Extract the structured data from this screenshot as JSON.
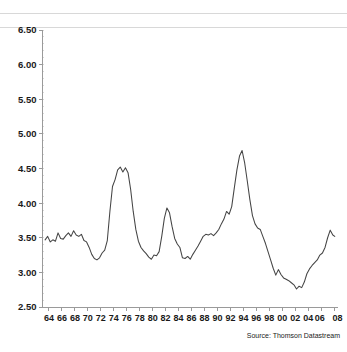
{
  "source_note": "Source: Thomson Datastream",
  "axes": {
    "y_ticks": [
      "2.50",
      "3.00",
      "3.50",
      "4.00",
      "4.50",
      "5.00",
      "5.50",
      "6.00",
      "6.50"
    ],
    "x_ticks": [
      "64",
      "66",
      "68",
      "70",
      "72",
      "74",
      "76",
      "78",
      "80",
      "82",
      "84",
      "86",
      "88",
      "90",
      "92",
      "94",
      "96",
      "98",
      "00",
      "02",
      "04",
      "06",
      "08"
    ]
  },
  "style": {
    "line_color": "#444444",
    "axis_color": "#9a9a9a",
    "text_color": "#1a1a1a",
    "background": "#ffffff"
  },
  "chart_data": {
    "type": "line",
    "title": "",
    "subtitle": "",
    "xlabel": "",
    "ylabel": "",
    "xlim": [
      1963.0,
      2008.6
    ],
    "ylim": [
      2.5,
      6.5
    ],
    "y_tick_step": 0.5,
    "x_tick_step": 2,
    "grid": false,
    "legend": null,
    "annotations": [
      "Source: Thomson Datastream"
    ],
    "series": [
      {
        "name": "series-1",
        "x": [
          1963.4,
          1963.8,
          1964.2,
          1964.6,
          1965.0,
          1965.4,
          1965.8,
          1966.2,
          1966.6,
          1967.0,
          1967.4,
          1967.8,
          1968.2,
          1968.6,
          1969.0,
          1969.4,
          1969.8,
          1970.2,
          1970.6,
          1971.0,
          1971.4,
          1971.8,
          1972.2,
          1972.6,
          1973.0,
          1973.4,
          1973.8,
          1974.2,
          1974.6,
          1975.0,
          1975.4,
          1975.8,
          1976.2,
          1976.6,
          1977.0,
          1977.4,
          1977.8,
          1978.2,
          1978.6,
          1979.0,
          1979.4,
          1979.8,
          1980.2,
          1980.6,
          1981.0,
          1981.4,
          1981.8,
          1982.2,
          1982.6,
          1983.0,
          1983.4,
          1983.8,
          1984.2,
          1984.6,
          1985.0,
          1985.4,
          1985.8,
          1986.2,
          1986.6,
          1987.0,
          1987.4,
          1987.8,
          1988.2,
          1988.6,
          1989.0,
          1989.4,
          1989.8,
          1990.2,
          1990.6,
          1991.0,
          1991.4,
          1991.8,
          1992.2,
          1992.6,
          1993.0,
          1993.4,
          1993.8,
          1994.2,
          1994.6,
          1995.0,
          1995.4,
          1995.8,
          1996.2,
          1996.6,
          1997.0,
          1997.4,
          1997.8,
          1998.2,
          1998.6,
          1999.0,
          1999.4,
          1999.8,
          2000.2,
          2000.6,
          2001.0,
          2001.4,
          2001.8,
          2002.2,
          2002.6,
          2003.0,
          2003.4,
          2003.8,
          2004.2,
          2004.6,
          2005.0,
          2005.4,
          2005.8,
          2006.2,
          2006.6,
          2007.0,
          2007.4,
          2007.8,
          2008.1
        ],
        "y": [
          3.47,
          3.52,
          3.44,
          3.47,
          3.45,
          3.57,
          3.49,
          3.48,
          3.53,
          3.57,
          3.52,
          3.6,
          3.54,
          3.52,
          3.55,
          3.46,
          3.44,
          3.36,
          3.26,
          3.2,
          3.18,
          3.21,
          3.28,
          3.32,
          3.46,
          3.88,
          4.24,
          4.34,
          4.48,
          4.52,
          4.45,
          4.51,
          4.44,
          4.2,
          3.88,
          3.62,
          3.45,
          3.36,
          3.31,
          3.27,
          3.22,
          3.19,
          3.25,
          3.24,
          3.3,
          3.52,
          3.78,
          3.93,
          3.86,
          3.66,
          3.49,
          3.41,
          3.36,
          3.21,
          3.2,
          3.23,
          3.19,
          3.26,
          3.32,
          3.38,
          3.45,
          3.52,
          3.55,
          3.54,
          3.56,
          3.53,
          3.57,
          3.62,
          3.7,
          3.77,
          3.88,
          3.84,
          3.95,
          4.22,
          4.48,
          4.68,
          4.76,
          4.58,
          4.32,
          4.05,
          3.82,
          3.7,
          3.64,
          3.62,
          3.52,
          3.42,
          3.3,
          3.18,
          3.06,
          2.96,
          3.04,
          2.97,
          2.92,
          2.9,
          2.88,
          2.85,
          2.82,
          2.76,
          2.8,
          2.78,
          2.86,
          2.98,
          3.05,
          3.1,
          3.14,
          3.18,
          3.25,
          3.28,
          3.36,
          3.5,
          3.61,
          3.54,
          3.52
        ]
      }
    ],
    "series_tail": {
      "name": "series-1-continued",
      "x": [
        2008.1,
        2008.2,
        2008.3,
        2008.4,
        2008.5
      ],
      "y": [
        3.52,
        3.7,
        3.88,
        4.3,
        5.0
      ]
    },
    "notable_points": [
      {
        "label": "early-plateau",
        "x": 1965,
        "y": 3.5
      },
      {
        "label": "1969-dip",
        "x": 1969.8,
        "y": 3.18
      },
      {
        "label": "1973-peak",
        "x": 1973.2,
        "y": 4.52
      },
      {
        "label": "1976-trough",
        "x": 1976.2,
        "y": 3.2
      },
      {
        "label": "1979-peak",
        "x": 1978.8,
        "y": 3.93
      },
      {
        "label": "1982-trough",
        "x": 1981.6,
        "y": 3.18
      },
      {
        "label": "1988-peak",
        "x": 1988.2,
        "y": 4.76
      },
      {
        "label": "1994-minimum",
        "x": 1994.7,
        "y": 2.76
      },
      {
        "label": "2006-peak",
        "x": 2005.9,
        "y": 6.12
      },
      {
        "label": "final-value",
        "x": 2007.4,
        "y": 5.65
      }
    ]
  }
}
